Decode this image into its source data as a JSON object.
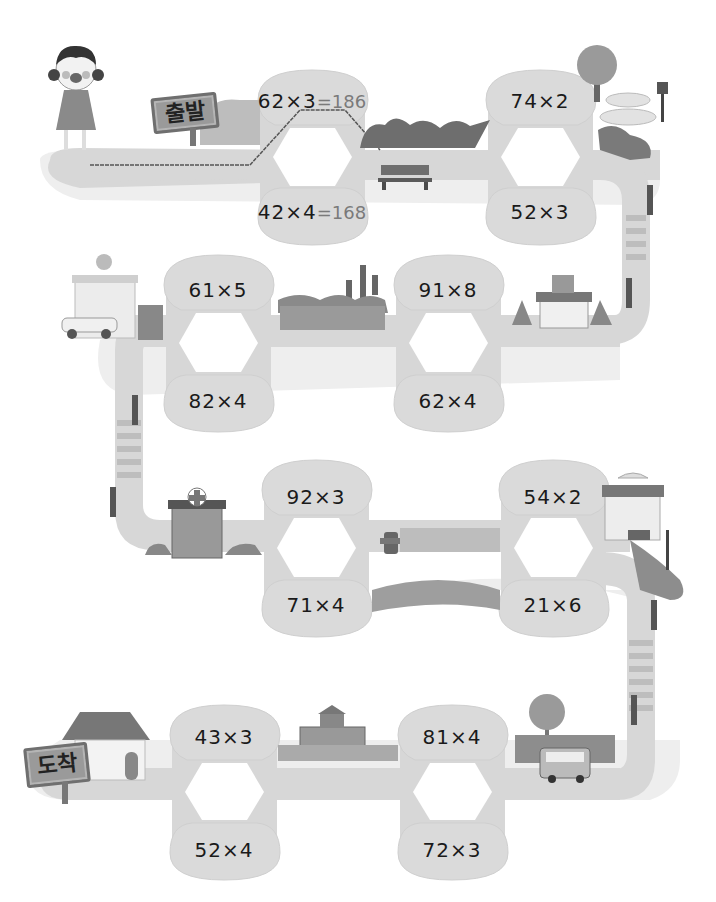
{
  "start_sign": "출발",
  "end_sign": "도착",
  "colors": {
    "road": "#d7d7d7",
    "bubble": "#dadada",
    "text": "#1a1a1a",
    "answer_text": "#7a7a7a",
    "path_line": "#555555"
  },
  "rows": [
    {
      "pairs": [
        {
          "top": {
            "expr": "62×3",
            "answer": "=186"
          },
          "bottom": {
            "expr": "42×4",
            "answer": "=168"
          }
        },
        {
          "top": {
            "expr": "74×2",
            "answer": ""
          },
          "bottom": {
            "expr": "52×3",
            "answer": ""
          }
        }
      ]
    },
    {
      "pairs": [
        {
          "top": {
            "expr": "61×5",
            "answer": ""
          },
          "bottom": {
            "expr": "82×4",
            "answer": ""
          }
        },
        {
          "top": {
            "expr": "91×8",
            "answer": ""
          },
          "bottom": {
            "expr": "62×4",
            "answer": ""
          }
        }
      ]
    },
    {
      "pairs": [
        {
          "top": {
            "expr": "92×3",
            "answer": ""
          },
          "bottom": {
            "expr": "71×4",
            "answer": ""
          }
        },
        {
          "top": {
            "expr": "54×2",
            "answer": ""
          },
          "bottom": {
            "expr": "21×6",
            "answer": ""
          }
        }
      ]
    },
    {
      "pairs": [
        {
          "top": {
            "expr": "43×3",
            "answer": ""
          },
          "bottom": {
            "expr": "52×4",
            "answer": ""
          }
        },
        {
          "top": {
            "expr": "81×4",
            "answer": ""
          },
          "bottom": {
            "expr": "72×3",
            "answer": ""
          }
        }
      ]
    }
  ],
  "decorations": [
    "girl-character",
    "start-sign",
    "bushes",
    "bench",
    "tree",
    "fountain",
    "street-lamp",
    "traffic-light",
    "crosswalk",
    "police-station",
    "police-car",
    "cactus-tree",
    "fence",
    "shop",
    "pine-tree",
    "hospital",
    "fire-hydrant",
    "cafe-building",
    "house",
    "end-sign",
    "school",
    "bus"
  ]
}
